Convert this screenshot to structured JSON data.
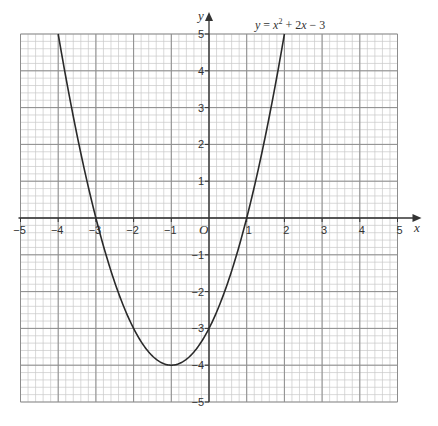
{
  "chart_data": {
    "type": "line",
    "equation_label": "y = x² + 2x − 3",
    "xlabel": "x",
    "ylabel": "y",
    "xlim": [
      -5,
      5
    ],
    "ylim": [
      -5,
      5
    ],
    "grid": true,
    "grid_minor_divisions": 5,
    "x_tick_labels": [
      "−5",
      "−4",
      "−3",
      "−2",
      "−1",
      "O",
      "1",
      "2",
      "3",
      "4",
      "5"
    ],
    "y_tick_labels": [
      "5",
      "4",
      "3",
      "2",
      "1",
      "−1",
      "−2",
      "−3",
      "−4",
      "−5"
    ],
    "series": [
      {
        "name": "y = x² + 2x − 3",
        "x": [
          -4,
          -3.5,
          -3,
          -2.5,
          -2,
          -1.5,
          -1,
          -0.5,
          0,
          0.5,
          1,
          1.5,
          2
        ],
        "y": [
          5,
          2.25,
          0,
          -1.75,
          -3,
          -3.75,
          -4,
          -3.75,
          -3,
          -1.75,
          0,
          2.25,
          5
        ]
      }
    ],
    "annotations": {
      "roots": [
        -3,
        1
      ],
      "vertex": [
        -1,
        -4
      ],
      "y_intercept": -3
    }
  }
}
